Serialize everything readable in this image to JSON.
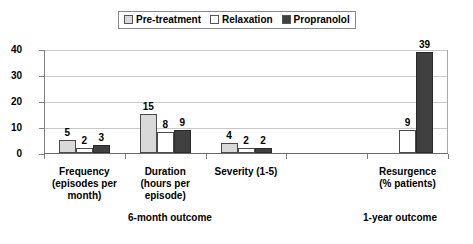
{
  "legend": {
    "entries": [
      {
        "label": "Pre-treatment",
        "color": "#d9d9d9",
        "swatch": "legend-swatch-pre-treatment"
      },
      {
        "label": "Relaxation",
        "color": "#ffffff",
        "swatch": "legend-swatch-relaxation"
      },
      {
        "label": "Propranolol",
        "color": "#404040",
        "swatch": "legend-swatch-propranolol"
      }
    ]
  },
  "axis": {
    "y_ticks": [
      "0",
      "10",
      "20",
      "30",
      "40"
    ]
  },
  "sections": [
    {
      "label": "6-month outcome"
    },
    {
      "label": "1-year outcome"
    }
  ],
  "chart_data": {
    "type": "bar",
    "title": "",
    "xlabel": "",
    "ylabel": "",
    "ylim": [
      0,
      40
    ],
    "grid": true,
    "legend_position": "top-center",
    "categories": [
      "Frequency (episodes per month)",
      "Duration (hours per episode)",
      "Severity (1-5)",
      "",
      "Resurgence (% patients)"
    ],
    "category_lines": [
      [
        "Frequency",
        "(episodes per",
        "month)"
      ],
      [
        "Duration",
        "(hours per",
        "episode)"
      ],
      [
        "Severity (1-5)"
      ],
      [
        ""
      ],
      [
        "Resurgence",
        "(% patients)"
      ]
    ],
    "series": [
      {
        "name": "Pre-treatment",
        "color": "#d9d9d9",
        "values": [
          5,
          15,
          4,
          null,
          null
        ]
      },
      {
        "name": "Relaxation",
        "color": "#ffffff",
        "values": [
          2,
          8,
          2,
          null,
          9
        ]
      },
      {
        "name": "Propranolol",
        "color": "#404040",
        "values": [
          3,
          9,
          2,
          null,
          39
        ]
      }
    ]
  }
}
